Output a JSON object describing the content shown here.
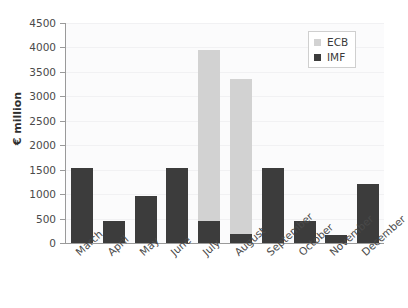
{
  "chart_data": {
    "type": "bar",
    "subtype": "stacked-vertical-bar",
    "title": "",
    "xlabel": "",
    "ylabel": "€ million",
    "ylim": [
      0,
      4500
    ],
    "ytick_step": 500,
    "yticks": [
      "4500",
      "4000",
      "3500",
      "3000",
      "2500",
      "2000",
      "1500",
      "1000",
      "500",
      "0"
    ],
    "ytick_values": [
      4500,
      4000,
      3500,
      3000,
      2500,
      2000,
      1500,
      1000,
      500,
      0
    ],
    "grid": true,
    "legend_position": "top-right",
    "categories": [
      "March",
      "April",
      "May",
      "June",
      "July",
      "August",
      "September",
      "October",
      "November",
      "December"
    ],
    "series": [
      {
        "name": "IMF",
        "color": "#3c3c3c",
        "values": [
          1530,
          450,
          970,
          1530,
          450,
          180,
          1530,
          450,
          155,
          1200
        ]
      },
      {
        "name": "ECB",
        "color": "#d2d2d2",
        "values": [
          0,
          0,
          0,
          0,
          3500,
          3170,
          0,
          0,
          0,
          0
        ]
      }
    ],
    "totals": [
      1530,
      450,
      970,
      1530,
      3950,
      3350,
      1530,
      450,
      155,
      1200
    ]
  },
  "legend": {
    "entries": [
      {
        "label": "ECB",
        "swatch": "ecb-swatch"
      },
      {
        "label": "IMF",
        "swatch": "imf-swatch"
      }
    ]
  },
  "colors": {
    "imf": "#3c3c3c",
    "ecb": "#d2d2d2",
    "axis": "#9a9a9a",
    "grid": "#f1f1f3",
    "plot_background": "#fbfbfc",
    "text": "#3a3a3a"
  }
}
